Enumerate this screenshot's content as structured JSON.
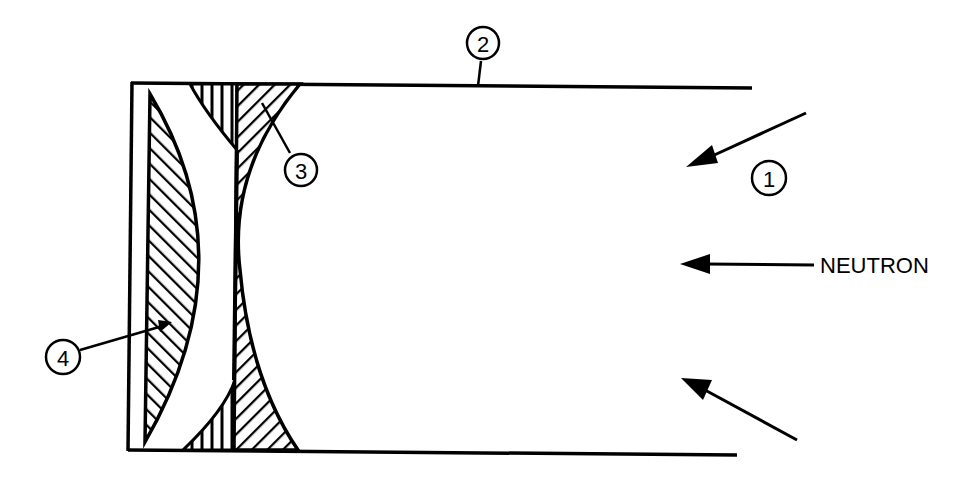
{
  "diagram": {
    "callouts": [
      {
        "id": "1",
        "label": "1",
        "x": 769,
        "y": 178
      },
      {
        "id": "2",
        "label": "2",
        "x": 483,
        "y": 43
      },
      {
        "id": "3",
        "label": "3",
        "x": 301,
        "y": 170
      },
      {
        "id": "4",
        "label": "4",
        "x": 63,
        "y": 357
      }
    ],
    "neutron_label": "NEUTRON",
    "colors": {
      "ink": "#000000",
      "background": "#ffffff"
    }
  }
}
